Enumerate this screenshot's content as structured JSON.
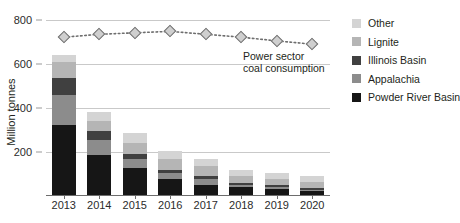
{
  "chart_data": {
    "type": "bar",
    "title": "",
    "subtitle": "",
    "xlabel": "",
    "ylabel": "Million tonnes",
    "ylim": [
      0,
      800
    ],
    "yticks": [
      200,
      400,
      600,
      800
    ],
    "grid": true,
    "legend_position": "right",
    "categories": [
      "2013",
      "2014",
      "2015",
      "2016",
      "2017",
      "2018",
      "2019",
      "2020"
    ],
    "stacked": true,
    "series": [
      {
        "name": "Powder River Basin",
        "color": "#161616",
        "values": [
          325,
          188,
          128,
          78,
          52,
          40,
          34,
          22
        ]
      },
      {
        "name": "Appalachia",
        "color": "#8c8c8c",
        "values": [
          133,
          66,
          40,
          28,
          26,
          8,
          6,
          6
        ]
      },
      {
        "name": "Illinois Basin",
        "color": "#404040",
        "values": [
          78,
          42,
          22,
          12,
          12,
          10,
          8,
          8
        ]
      },
      {
        "name": "Lignite",
        "color": "#b5b5b5",
        "values": [
          72,
          44,
          50,
          50,
          46,
          34,
          30,
          30
        ]
      },
      {
        "name": "Other",
        "color": "#d4d4d4",
        "values": [
          32,
          40,
          46,
          38,
          32,
          28,
          26,
          26
        ]
      }
    ],
    "overlay_line": {
      "name": "Power sector coal consumption",
      "values": [
        722,
        735,
        742,
        748,
        735,
        722,
        705,
        690
      ],
      "marker": "diamond",
      "style": "dotted",
      "color": "#6e6e6e"
    },
    "annotation": {
      "line1": "Power sector",
      "line2": "coal consumption"
    }
  },
  "legend": {
    "items": [
      {
        "label": "Other",
        "color": "#d4d4d4"
      },
      {
        "label": "Lignite",
        "color": "#b5b5b5"
      },
      {
        "label": "Illinois Basin",
        "color": "#404040"
      },
      {
        "label": "Appalachia",
        "color": "#8c8c8c"
      },
      {
        "label": "Powder River Basin",
        "color": "#161616"
      }
    ]
  }
}
